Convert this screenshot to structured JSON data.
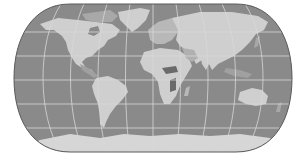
{
  "map": {
    "projection": "pseudocylindrical (Eckert IV style)",
    "style": "grayscale",
    "colors": {
      "background": "#ffffff",
      "ocean": "#8a8a8a",
      "land": "#cfcfcf",
      "land_dark": "#6a6a6a",
      "graticule": "#d8d8d8",
      "outline": "#5a5a5a"
    },
    "graticule": {
      "parallels_y": [
        32,
        56,
        80,
        104,
        128
      ],
      "meridian_count": 12
    },
    "continents": [
      "North America",
      "South America",
      "Europe",
      "Africa",
      "Asia",
      "Australia",
      "Antarctica",
      "Greenland"
    ]
  }
}
